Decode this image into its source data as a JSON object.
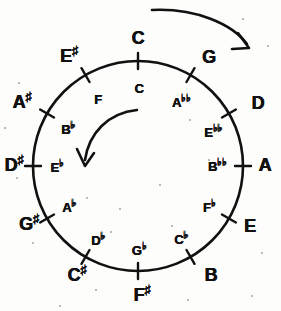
{
  "figure": {
    "kind": "circle-of-fifths",
    "background_color": "#fdfdfc",
    "ink_color": "#111111"
  },
  "chart_data": {
    "type": "pie",
    "xlabel": "",
    "ylabel": "",
    "legend": [],
    "grid": false,
    "center": {
      "x": 138,
      "y": 166
    },
    "radius": 105,
    "categories": [
      "C",
      "G",
      "D",
      "A",
      "E",
      "B",
      "F#",
      "C#",
      "G#",
      "D#",
      "A#",
      "E#"
    ],
    "values": [
      30,
      30,
      30,
      30,
      30,
      30,
      30,
      30,
      30,
      30,
      30,
      30
    ],
    "positions": [
      {
        "index": 0,
        "angle_deg": 0,
        "outer_label": "C",
        "outer_note": "C",
        "outer_accidental": "",
        "inner_label": "C",
        "inner_note": "C",
        "inner_accidental": "",
        "outer_x": 138,
        "outer_y": 38,
        "inner_x": 139,
        "inner_y": 88
      },
      {
        "index": 1,
        "angle_deg": 30,
        "outer_label": "G",
        "outer_note": "G",
        "outer_accidental": "",
        "inner_label": "Abb",
        "inner_note": "A",
        "inner_accidental": "bb",
        "outer_x": 209,
        "outer_y": 57,
        "inner_x": 181,
        "inner_y": 101
      },
      {
        "index": 2,
        "angle_deg": 60,
        "outer_label": "D",
        "outer_note": "D",
        "outer_accidental": "",
        "inner_label": "Ebb",
        "inner_note": "E",
        "inner_accidental": "bb",
        "outer_x": 258,
        "outer_y": 103,
        "inner_x": 213,
        "inner_y": 131
      },
      {
        "index": 3,
        "angle_deg": 90,
        "outer_label": "A",
        "outer_note": "A",
        "outer_accidental": "",
        "inner_label": "Bbb",
        "inner_note": "B",
        "inner_accidental": "bb",
        "outer_x": 265,
        "outer_y": 165,
        "inner_x": 217,
        "inner_y": 165
      },
      {
        "index": 4,
        "angle_deg": 120,
        "outer_label": "E",
        "outer_note": "E",
        "outer_accidental": "",
        "inner_label": "Fb",
        "inner_note": "F",
        "inner_accidental": "b",
        "outer_x": 250,
        "outer_y": 226,
        "inner_x": 209,
        "inner_y": 206
      },
      {
        "index": 5,
        "angle_deg": 150,
        "outer_label": "B",
        "outer_note": "B",
        "outer_accidental": "",
        "inner_label": "Cb",
        "inner_note": "C",
        "inner_accidental": "b",
        "outer_x": 211,
        "outer_y": 275,
        "inner_x": 181,
        "inner_y": 238
      },
      {
        "index": 6,
        "angle_deg": 180,
        "outer_label": "F#",
        "outer_note": "F",
        "outer_accidental": "#",
        "inner_label": "Gb",
        "inner_note": "G",
        "inner_accidental": "b",
        "outer_x": 142,
        "outer_y": 294,
        "inner_x": 139,
        "inner_y": 249
      },
      {
        "index": 7,
        "angle_deg": 210,
        "outer_label": "C#",
        "outer_note": "C",
        "outer_accidental": "#",
        "inner_label": "Db",
        "inner_note": "D",
        "inner_accidental": "b",
        "outer_x": 77,
        "outer_y": 274,
        "inner_x": 98,
        "inner_y": 239
      },
      {
        "index": 8,
        "angle_deg": 240,
        "outer_label": "G#",
        "outer_note": "G",
        "outer_accidental": "#",
        "inner_label": "Ab",
        "inner_note": "A",
        "inner_accidental": "b",
        "outer_x": 29,
        "outer_y": 223,
        "inner_x": 69,
        "inner_y": 206
      },
      {
        "index": 9,
        "angle_deg": 270,
        "outer_label": "D#",
        "outer_note": "D",
        "outer_accidental": "#",
        "inner_label": "Eb",
        "inner_note": "E",
        "inner_accidental": "b",
        "outer_x": 14,
        "outer_y": 164,
        "inner_x": 57,
        "inner_y": 166
      },
      {
        "index": 10,
        "angle_deg": 300,
        "outer_label": "A#",
        "outer_note": "A",
        "outer_accidental": "#",
        "inner_label": "Bb",
        "inner_note": "B",
        "inner_accidental": "b",
        "outer_x": 22,
        "outer_y": 101,
        "inner_x": 68,
        "inner_y": 128
      },
      {
        "index": 11,
        "angle_deg": 330,
        "outer_label": "E#",
        "outer_note": "E",
        "outer_accidental": "#",
        "inner_label": "F",
        "inner_note": "F",
        "inner_accidental": "",
        "outer_x": 69,
        "outer_y": 55,
        "inner_x": 98,
        "inner_y": 99
      }
    ],
    "annotations": [
      {
        "name": "outer-arrow",
        "description": "curved arrow above circle pointing clockwise",
        "direction": "clockwise",
        "label": ""
      },
      {
        "name": "inner-arrow",
        "description": "curved arrow inside circle pointing counterclockwise",
        "direction": "counterclockwise",
        "label": ""
      }
    ]
  },
  "specks": [
    {
      "x": 243,
      "y": 19,
      "r": 1.4
    },
    {
      "x": 268,
      "y": 46,
      "r": 1.1
    },
    {
      "x": 19,
      "y": 83,
      "r": 1.2
    },
    {
      "x": 190,
      "y": 120,
      "r": 1.0
    },
    {
      "x": 17,
      "y": 178,
      "r": 1.3
    },
    {
      "x": 87,
      "y": 198,
      "r": 1.1
    },
    {
      "x": 160,
      "y": 185,
      "r": 1.0
    },
    {
      "x": 209,
      "y": 160,
      "r": 0.9
    },
    {
      "x": 120,
      "y": 209,
      "r": 1.0
    },
    {
      "x": 172,
      "y": 226,
      "r": 1.1
    },
    {
      "x": 111,
      "y": 232,
      "r": 0.9
    },
    {
      "x": 33,
      "y": 243,
      "r": 1.0
    },
    {
      "x": 96,
      "y": 290,
      "r": 1.2
    },
    {
      "x": 262,
      "y": 253,
      "r": 1.1
    },
    {
      "x": 252,
      "y": 296,
      "r": 1.0
    },
    {
      "x": 188,
      "y": 300,
      "r": 0.9
    },
    {
      "x": 60,
      "y": 306,
      "r": 1.0
    },
    {
      "x": 5,
      "y": 128,
      "r": 0.9
    }
  ]
}
